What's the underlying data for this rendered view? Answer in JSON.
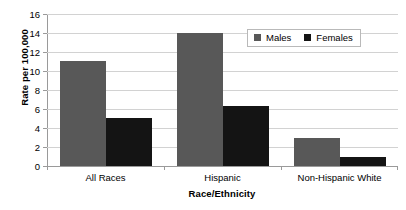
{
  "chart_data": {
    "type": "bar",
    "title": "",
    "subtitle": "",
    "xlabel": "Race/Ethnicity",
    "ylabel": "Rate per 100,000",
    "categories": [
      "All Races",
      "Hispanic",
      "Non-Hispanic White"
    ],
    "series": [
      {
        "name": "Males",
        "values": [
          11.1,
          14.0,
          2.9
        ],
        "color": "#585858"
      },
      {
        "name": "Females",
        "values": [
          5.1,
          6.3,
          1.0
        ],
        "color": "#141414"
      }
    ],
    "ylim": [
      0,
      16
    ],
    "ytick_step": 2,
    "ytick_labels": [
      "0",
      "2",
      "4",
      "6",
      "8",
      "10",
      "12",
      "14",
      "16"
    ],
    "grid": "horizontal",
    "legend_position": "top-right-inside",
    "background": "#ffffff",
    "gridline_color": "#d2d2d2",
    "axis_color": "#9a9a9a"
  },
  "legend": {
    "items": [
      {
        "label": "Males"
      },
      {
        "label": "Females"
      }
    ]
  },
  "axes": {
    "x_title": "Race/Ethnicity",
    "y_title": "Rate per 100,000"
  }
}
